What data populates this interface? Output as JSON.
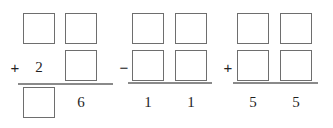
{
  "worksheet": {
    "title": "vertical arithmetic fill-in-the-blank problems",
    "background_color": "#ffffff",
    "box_border_color": "#6e6e6e",
    "rule_color": "#8a8a8a",
    "digit_color": "#1f1f1f",
    "problems": [
      {
        "id": "problem-1",
        "operator": "+",
        "columns": [
          {
            "id": "p1-col-1",
            "cells": [
              {
                "row": "addend-1",
                "kind": "box",
                "value": ""
              },
              {
                "row": "addend-2",
                "kind": "digit",
                "value": "2"
              },
              {
                "row": "sum",
                "kind": "box",
                "value": ""
              }
            ]
          },
          {
            "id": "p1-col-2",
            "cells": [
              {
                "row": "addend-1",
                "kind": "box",
                "value": ""
              },
              {
                "row": "addend-2",
                "kind": "box",
                "value": ""
              },
              {
                "row": "sum",
                "kind": "digit",
                "value": "6"
              }
            ]
          }
        ]
      },
      {
        "id": "problem-2",
        "operator": "−",
        "columns": [
          {
            "id": "p2-col-1",
            "cells": [
              {
                "row": "minuend",
                "kind": "box",
                "value": ""
              },
              {
                "row": "subtrahend",
                "kind": "box",
                "value": ""
              },
              {
                "row": "difference",
                "kind": "digit",
                "value": "1"
              }
            ]
          },
          {
            "id": "p2-col-2",
            "cells": [
              {
                "row": "minuend",
                "kind": "box",
                "value": ""
              },
              {
                "row": "subtrahend",
                "kind": "box",
                "value": ""
              },
              {
                "row": "difference",
                "kind": "digit",
                "value": "1"
              }
            ]
          }
        ]
      },
      {
        "id": "problem-3",
        "operator": "+",
        "columns": [
          {
            "id": "p3-col-1",
            "cells": [
              {
                "row": "addend-1",
                "kind": "box",
                "value": ""
              },
              {
                "row": "addend-2",
                "kind": "box",
                "value": ""
              },
              {
                "row": "sum",
                "kind": "digit",
                "value": "5"
              }
            ]
          },
          {
            "id": "p3-col-2",
            "cells": [
              {
                "row": "addend-1",
                "kind": "box",
                "value": ""
              },
              {
                "row": "addend-2",
                "kind": "box",
                "value": ""
              },
              {
                "row": "sum",
                "kind": "digit",
                "value": "5"
              }
            ]
          }
        ]
      }
    ]
  }
}
